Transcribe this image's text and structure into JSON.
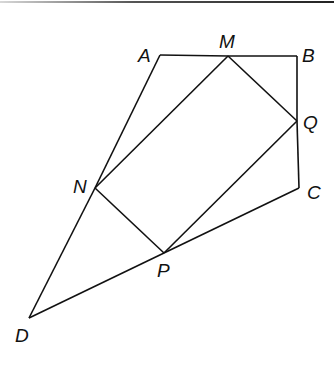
{
  "diagram": {
    "title": "",
    "points": [
      {
        "id": "A",
        "label": "A",
        "x": 160,
        "y": 55,
        "lx": 138,
        "ly": 62
      },
      {
        "id": "M",
        "label": "M",
        "x": 228,
        "y": 56,
        "lx": 219,
        "ly": 48
      },
      {
        "id": "B",
        "label": "B",
        "x": 297,
        "y": 56,
        "lx": 302,
        "ly": 62
      },
      {
        "id": "Q",
        "label": "Q",
        "x": 297,
        "y": 121,
        "lx": 303,
        "ly": 129
      },
      {
        "id": "C",
        "label": "C",
        "x": 299,
        "y": 188,
        "lx": 307,
        "ly": 199
      },
      {
        "id": "N",
        "label": "N",
        "x": 95,
        "y": 188,
        "lx": 73,
        "ly": 193
      },
      {
        "id": "P",
        "label": "P",
        "x": 164,
        "y": 253,
        "lx": 157,
        "ly": 277
      },
      {
        "id": "D",
        "label": "D",
        "x": 29,
        "y": 318,
        "lx": 15,
        "ly": 342
      }
    ],
    "segments": [
      [
        "A",
        "M"
      ],
      [
        "M",
        "B"
      ],
      [
        "B",
        "Q"
      ],
      [
        "Q",
        "C"
      ],
      [
        "C",
        "P"
      ],
      [
        "P",
        "D"
      ],
      [
        "D",
        "N"
      ],
      [
        "N",
        "A"
      ],
      [
        "M",
        "N"
      ],
      [
        "N",
        "P"
      ],
      [
        "P",
        "Q"
      ],
      [
        "Q",
        "M"
      ]
    ],
    "line_color": "#111111"
  }
}
